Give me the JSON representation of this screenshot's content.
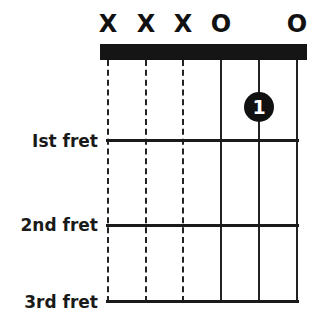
{
  "diagram": {
    "type": "guitar-chord-chart",
    "string_markers": [
      "X",
      "X",
      "X",
      "O",
      "",
      "O"
    ],
    "string_states": [
      "muted",
      "muted",
      "muted",
      "open",
      "fretted",
      "open"
    ],
    "fret_labels": [
      "Ist fret",
      "2nd fret",
      "3rd fret"
    ],
    "fingerings": [
      {
        "string": 5,
        "fret": 1,
        "finger": "1"
      }
    ],
    "colors": {
      "ink": "#111111",
      "background": "#ffffff",
      "finger_text": "#ffffff"
    }
  }
}
